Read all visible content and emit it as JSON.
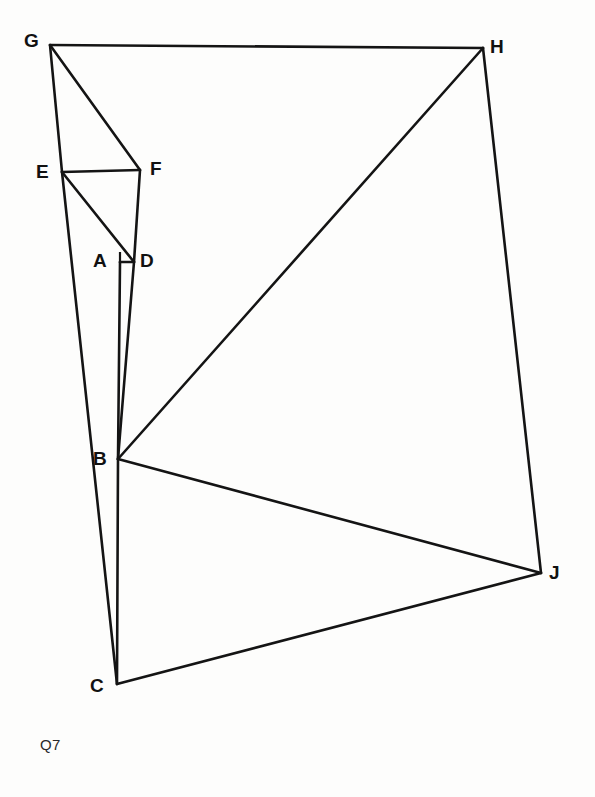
{
  "figure": {
    "caption": "Q7",
    "caption_position": {
      "x": 40,
      "y": 737
    },
    "stroke_color": "#141414",
    "background_color": "#fdfdfc",
    "width": 595,
    "height": 797,
    "vertices": [
      {
        "id": "A",
        "label": "A",
        "x": 120,
        "y": 262,
        "label_x": 93,
        "label_y": 251
      },
      {
        "id": "B",
        "label": "B",
        "x": 118,
        "y": 459,
        "label_x": 93,
        "label_y": 449
      },
      {
        "id": "C",
        "label": "C",
        "x": 117,
        "y": 684,
        "label_x": 90,
        "label_y": 676
      },
      {
        "id": "D",
        "label": "D",
        "x": 134,
        "y": 262,
        "label_x": 140,
        "label_y": 251
      },
      {
        "id": "E",
        "label": "E",
        "x": 62,
        "y": 172,
        "label_x": 36,
        "label_y": 162
      },
      {
        "id": "F",
        "label": "F",
        "x": 140,
        "y": 170,
        "label_x": 150,
        "label_y": 159
      },
      {
        "id": "G",
        "label": "G",
        "x": 50,
        "y": 45,
        "label_x": 24,
        "label_y": 31
      },
      {
        "id": "H",
        "label": "H",
        "x": 483,
        "y": 48,
        "label_x": 490,
        "label_y": 37
      },
      {
        "id": "J",
        "label": "J",
        "x": 541,
        "y": 573,
        "label_x": 549,
        "label_y": 563
      }
    ],
    "edges": [
      {
        "name": "edge-G-H",
        "from": "G",
        "to": "H"
      },
      {
        "name": "edge-H-J",
        "from": "H",
        "to": "J"
      },
      {
        "name": "edge-J-C",
        "from": "J",
        "to": "C"
      },
      {
        "name": "edge-G-E",
        "from": "G",
        "to": "E"
      },
      {
        "name": "edge-E-C",
        "from": "E",
        "to": "C"
      },
      {
        "name": "edge-G-F",
        "from": "G",
        "to": "F"
      },
      {
        "name": "edge-E-F",
        "from": "E",
        "to": "F"
      },
      {
        "name": "edge-F-D",
        "from": "F",
        "to": "D"
      },
      {
        "name": "edge-E-D",
        "from": "E",
        "to": "D"
      },
      {
        "name": "edge-A-B",
        "from": "A",
        "to": "B"
      },
      {
        "name": "edge-D-B",
        "from": "D",
        "to": "B"
      },
      {
        "name": "edge-A-D",
        "from": "A",
        "to": "D"
      },
      {
        "name": "edge-B-H",
        "from": "B",
        "to": "H"
      },
      {
        "name": "edge-B-J",
        "from": "B",
        "to": "J"
      },
      {
        "name": "edge-B-C",
        "from": "B",
        "to": "C"
      }
    ],
    "right_angle": {
      "at_vertex": "D",
      "marker_points": "120,252 120,262 134,262"
    }
  }
}
